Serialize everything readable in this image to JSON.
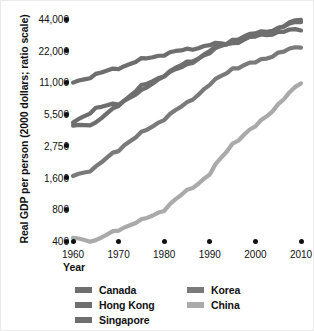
{
  "chart_data": {
    "type": "line",
    "title": "",
    "xlabel": "Year",
    "ylabel": "Real GDP per person (2000 dollars; ratio scale)",
    "scale": "ratio (log)",
    "grid": false,
    "legend_position": "bottom",
    "xlim": [
      1960,
      2010
    ],
    "ylim": [
      400,
      44000
    ],
    "xticks": [
      "1960",
      "1970",
      "1980",
      "1990",
      "2000",
      "2010"
    ],
    "xtick_values": [
      1960,
      1970,
      1980,
      1990,
      2000,
      2010
    ],
    "yticks": [
      "44,000",
      "22,000",
      "11,000",
      "5,500",
      "2,750",
      "1,600",
      "800",
      "400"
    ],
    "ytick_values": [
      44000,
      22000,
      11000,
      5500,
      2750,
      1600,
      800,
      400
    ],
    "series": [
      {
        "name": "Canada",
        "color": "#6e6e6e",
        "x": [
          1960,
          1965,
          1970,
          1975,
          1980,
          1985,
          1990,
          1995,
          2000,
          2005,
          2010
        ],
        "values": [
          11000,
          13000,
          15200,
          18000,
          20500,
          22500,
          25000,
          26000,
          30000,
          33000,
          35000
        ]
      },
      {
        "name": "Hong Kong",
        "color": "#6e6e6e",
        "x": [
          1960,
          1965,
          1970,
          1975,
          1980,
          1985,
          1990,
          1995,
          2000,
          2005,
          2010
        ],
        "values": [
          4600,
          6200,
          7000,
          9000,
          13000,
          16000,
          22000,
          27000,
          30000,
          36000,
          44000
        ]
      },
      {
        "name": "Singapore",
        "color": "#6e6e6e",
        "x": [
          1960,
          1965,
          1970,
          1975,
          1980,
          1985,
          1990,
          1995,
          2000,
          2005,
          2010
        ],
        "values": [
          4300,
          4500,
          6800,
          10000,
          13000,
          17000,
          21000,
          28000,
          32000,
          36000,
          42000
        ]
      },
      {
        "name": "Korea",
        "color": "#7a7a7a",
        "x": [
          1960,
          1965,
          1970,
          1975,
          1980,
          1985,
          1990,
          1995,
          2000,
          2005,
          2010
        ],
        "values": [
          1650,
          1900,
          2600,
          3600,
          5000,
          7000,
          10500,
          15000,
          17000,
          21000,
          24000
        ]
      },
      {
        "name": "China",
        "color": "#aaaaaa",
        "x": [
          1960,
          1965,
          1970,
          1975,
          1980,
          1985,
          1990,
          1995,
          2000,
          2005,
          2010
        ],
        "values": [
          430,
          400,
          520,
          620,
          800,
          1200,
          1700,
          2900,
          4200,
          6800,
          11000
        ]
      }
    ]
  },
  "axis": {
    "y_title": "Real GDP per person (2000 dollars; ratio scale)",
    "x_title": "Year"
  },
  "legend": {
    "left_column": [
      {
        "label": "Canada",
        "color": "#6e6e6e"
      },
      {
        "label": "Hong Kong",
        "color": "#6e6e6e"
      },
      {
        "label": "Singapore",
        "color": "#6e6e6e"
      }
    ],
    "right_column": [
      {
        "label": "Korea",
        "color": "#7a7a7a"
      },
      {
        "label": "China",
        "color": "#aaaaaa"
      }
    ]
  }
}
